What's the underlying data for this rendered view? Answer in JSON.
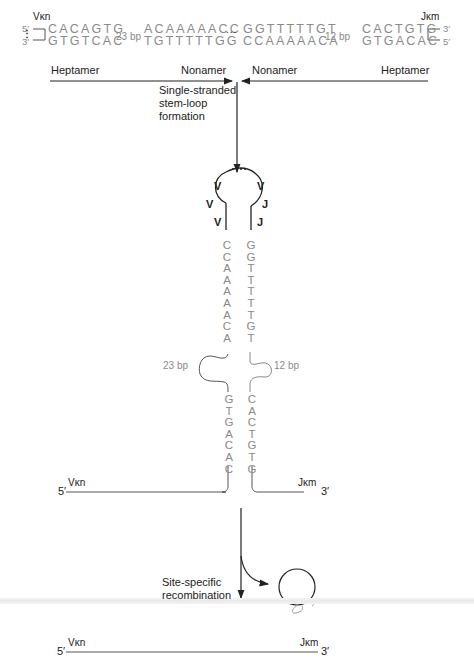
{
  "top": {
    "left_segment": "Vκn",
    "right_segment": "Jκm",
    "left_ends": {
      "top": "5′",
      "bottom": "3′"
    },
    "right_ends": {
      "top": "3′",
      "bottom": "5′"
    },
    "left_heptamer_top": "CACAGTG",
    "left_heptamer_bottom": "GTGTCAC",
    "left_spacer": "23 bp",
    "left_nonamer_top": "ACAAAAACC",
    "left_nonamer_bottom": "TGTTTTTGG",
    "ellipsis": "...",
    "right_nonamer_top": "GGTTTTTGT",
    "right_nonamer_bottom": "CCAAAAACA",
    "right_spacer": "12 bp",
    "right_heptamer_top": "CACTGTG",
    "right_heptamer_bottom": "GTGACAC",
    "arrow_left_labels": [
      "Heptamer",
      "Nonamer"
    ],
    "arrow_right_labels": [
      "Nonamer",
      "Heptamer"
    ]
  },
  "step1": {
    "label_line1": "Single-stranded",
    "label_line2": "stem-loop",
    "label_line3": "formation"
  },
  "loop": {
    "left_labels": [
      "V",
      "V",
      "V"
    ],
    "right_labels": [
      "V",
      "J",
      "J"
    ]
  },
  "stem": {
    "left_nonamer": [
      "C",
      "C",
      "A",
      "A",
      "A",
      "A",
      "A",
      "C",
      "A"
    ],
    "right_nonamer": [
      "G",
      "G",
      "T",
      "T",
      "T",
      "T",
      "T",
      "G",
      "T"
    ],
    "left_spacer": "23 bp",
    "right_spacer": "12 bp",
    "left_heptamer": [
      "G",
      "T",
      "G",
      "A",
      "C",
      "A",
      "C"
    ],
    "right_heptamer": [
      "C",
      "A",
      "C",
      "T",
      "G",
      "T",
      "G"
    ],
    "bottom_left_end": "5′",
    "bottom_left_segment": "Vκn",
    "bottom_right_segment": "Jκm",
    "bottom_right_end": "3′"
  },
  "step2": {
    "label_line1": "Site-specific",
    "label_line2": "recombination"
  },
  "product": {
    "left_end": "5′",
    "left_segment": "Vκn",
    "right_segment": "Jκm",
    "right_end": "3′"
  }
}
